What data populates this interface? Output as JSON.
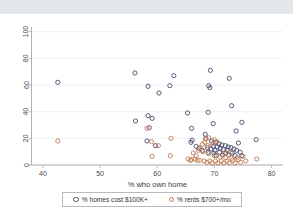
{
  "figure": {
    "background": "#ffffff",
    "top_band_color": "#e3e7ea"
  },
  "legend": {
    "position": "below-plot",
    "entries": [
      {
        "marker": "open-circle",
        "color": "#4a4a6e",
        "label": "% homes cost $100K+"
      },
      {
        "marker": "open-circle",
        "color": "#c07a52",
        "label": "% rents $700+/mo"
      }
    ]
  },
  "chart_data": {
    "type": "scatter",
    "title": "",
    "subtitle": "",
    "xlabel": "% who own home",
    "ylabel": "",
    "xlim": [
      38,
      82
    ],
    "ylim": [
      0,
      102
    ],
    "xticks": [
      40,
      50,
      60,
      70,
      80
    ],
    "yticks": [
      0,
      20,
      40,
      60,
      80,
      100
    ],
    "xtick_labels": [
      "40",
      "50",
      "60",
      "70",
      "80"
    ],
    "ytick_labels": [
      "0",
      "20",
      "40",
      "60",
      "80",
      "100"
    ],
    "grid": "horizontal",
    "legend_position": "bottom",
    "marker": "open-circle",
    "marker_size": 4.2,
    "series": [
      {
        "name": "% homes cost $100K+",
        "color": "#4a4a6e",
        "points": [
          [
            42.6,
            62.0
          ],
          [
            56.1,
            69.0
          ],
          [
            58.4,
            59.0
          ],
          [
            62.2,
            59.5
          ],
          [
            62.9,
            67.0
          ],
          [
            69.3,
            71.0
          ],
          [
            69.0,
            59.5
          ],
          [
            72.6,
            65.0
          ],
          [
            69.2,
            58.0
          ],
          [
            60.3,
            54.0
          ],
          [
            73.0,
            44.5
          ],
          [
            65.3,
            39.0
          ],
          [
            68.9,
            39.5
          ],
          [
            58.4,
            37.0
          ],
          [
            59.1,
            35.0
          ],
          [
            56.2,
            33.0
          ],
          [
            69.8,
            31.0
          ],
          [
            74.8,
            32.0
          ],
          [
            58.6,
            28.0
          ],
          [
            66.0,
            27.5
          ],
          [
            73.8,
            25.5
          ],
          [
            68.4,
            23.0
          ],
          [
            68.5,
            20.0
          ],
          [
            58.2,
            18.0
          ],
          [
            66.1,
            18.5
          ],
          [
            65.9,
            17.0
          ],
          [
            59.7,
            14.5
          ],
          [
            74.2,
            16.5
          ],
          [
            77.3,
            19.0
          ],
          [
            69.5,
            18.0
          ],
          [
            70.2,
            17.0
          ],
          [
            70.8,
            16.0
          ],
          [
            71.3,
            15.0
          ],
          [
            71.9,
            14.5
          ],
          [
            72.4,
            13.5
          ],
          [
            72.9,
            13.0
          ],
          [
            70.5,
            13.5
          ],
          [
            69.8,
            14.0
          ],
          [
            71.0,
            12.5
          ],
          [
            71.6,
            11.5
          ],
          [
            72.2,
            11.0
          ],
          [
            73.4,
            12.0
          ],
          [
            73.9,
            11.0
          ],
          [
            70.1,
            11.0
          ],
          [
            69.4,
            12.0
          ],
          [
            68.8,
            13.0
          ],
          [
            74.5,
            9.5
          ],
          [
            73.1,
            9.0
          ],
          [
            72.0,
            9.0
          ],
          [
            70.9,
            9.5
          ],
          [
            69.9,
            9.0
          ],
          [
            68.9,
            9.5
          ],
          [
            67.9,
            11.0
          ],
          [
            67.3,
            12.5
          ],
          [
            66.8,
            14.0
          ],
          [
            74.8,
            7.0
          ],
          [
            73.6,
            7.0
          ],
          [
            72.5,
            7.5
          ],
          [
            71.4,
            7.5
          ],
          [
            70.3,
            7.0
          ]
        ]
      },
      {
        "name": "% rents $700+/mo",
        "color": "#c07a52",
        "points": [
          [
            42.6,
            18.0
          ],
          [
            58.2,
            27.5
          ],
          [
            62.4,
            20.0
          ],
          [
            59.0,
            17.5
          ],
          [
            60.2,
            14.5
          ],
          [
            59.1,
            6.5
          ],
          [
            62.3,
            7.0
          ],
          [
            65.4,
            4.5
          ],
          [
            66.0,
            4.0
          ],
          [
            65.8,
            3.5
          ],
          [
            67.0,
            3.5
          ],
          [
            68.5,
            19.5
          ],
          [
            69.0,
            20.5
          ],
          [
            68.3,
            17.0
          ],
          [
            67.9,
            15.5
          ],
          [
            68.8,
            14.5
          ],
          [
            69.6,
            16.0
          ],
          [
            70.4,
            17.5
          ],
          [
            70.0,
            19.0
          ],
          [
            67.5,
            13.0
          ],
          [
            67.2,
            11.0
          ],
          [
            68.0,
            10.0
          ],
          [
            69.0,
            8.5
          ],
          [
            70.0,
            7.0
          ],
          [
            71.0,
            6.0
          ],
          [
            72.0,
            5.5
          ],
          [
            73.0,
            5.0
          ],
          [
            74.0,
            5.5
          ],
          [
            75.0,
            6.5
          ],
          [
            74.2,
            4.0
          ],
          [
            73.2,
            3.5
          ],
          [
            72.2,
            3.0
          ],
          [
            71.2,
            3.0
          ],
          [
            70.2,
            3.0
          ],
          [
            69.2,
            3.0
          ],
          [
            68.2,
            3.0
          ],
          [
            67.4,
            3.5
          ],
          [
            66.6,
            4.5
          ],
          [
            77.4,
            4.5
          ],
          [
            75.5,
            3.0
          ],
          [
            74.6,
            2.0
          ],
          [
            73.6,
            1.5
          ],
          [
            72.6,
            1.5
          ],
          [
            71.6,
            1.5
          ],
          [
            70.6,
            1.5
          ],
          [
            69.6,
            1.5
          ],
          [
            68.7,
            2.0
          ],
          [
            71.8,
            8.5
          ],
          [
            72.8,
            9.5
          ],
          [
            66.3,
            9.0
          ],
          [
            66.8,
            7.0
          ]
        ]
      }
    ]
  }
}
